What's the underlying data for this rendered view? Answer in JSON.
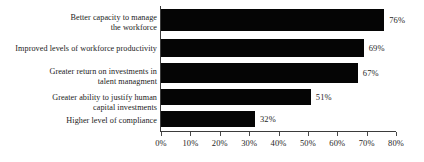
{
  "chart_data": {
    "type": "bar",
    "orientation": "horizontal",
    "title": "",
    "subtitle": "",
    "xlabel": "",
    "ylabel": "",
    "xlim": [
      0,
      80
    ],
    "grid": false,
    "legend": null,
    "bar_color": "#050505",
    "axis_color": "#3b3b3b",
    "text_color": "#1b1b1b",
    "background": "#ffffff",
    "xticks": [
      0,
      10,
      20,
      30,
      40,
      50,
      60,
      70,
      80
    ],
    "xtick_labels": [
      "0%",
      "10%",
      "20%",
      "30%",
      "40%",
      "50%",
      "60%",
      "70%",
      "80%"
    ],
    "categories": [
      "Better capacity to manage\nthe workforce",
      "Improved levels of workforce productivity",
      "Greater return on investments in\ntalent managment",
      "Greater ability to justify human\ncapital investments",
      "Higher level of compliance"
    ],
    "values": [
      76,
      69,
      67,
      51,
      32
    ],
    "data_labels": [
      "76%",
      "69%",
      "67%",
      "51%",
      "32%"
    ]
  },
  "rows": [
    {
      "label": "Better capacity to manage\nthe workforce",
      "value_label": "76%",
      "value": 76
    },
    {
      "label": "Improved levels of workforce productivity",
      "value_label": "69%",
      "value": 69
    },
    {
      "label": "Greater return on investments in\ntalent managment",
      "value_label": "67%",
      "value": 67
    },
    {
      "label": "Greater ability to justify human\ncapital investments",
      "value_label": "51%",
      "value": 51
    },
    {
      "label": "Higher level of compliance",
      "value_label": "32%",
      "value": 32
    }
  ],
  "axis": {
    "ticks": [
      {
        "label": "0%",
        "value": 0
      },
      {
        "label": "10%",
        "value": 10
      },
      {
        "label": "20%",
        "value": 20
      },
      {
        "label": "30%",
        "value": 30
      },
      {
        "label": "40%",
        "value": 40
      },
      {
        "label": "50%",
        "value": 50
      },
      {
        "label": "60%",
        "value": 60
      },
      {
        "label": "70%",
        "value": 70
      },
      {
        "label": "80%",
        "value": 80
      }
    ]
  }
}
